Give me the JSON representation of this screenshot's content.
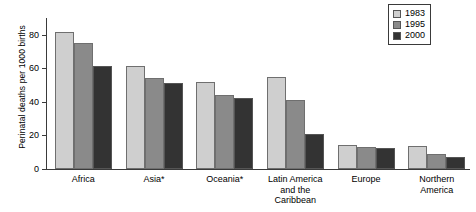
{
  "chart_data": {
    "type": "bar",
    "title": "",
    "xlabel": "",
    "ylabel": "Perinatal deaths per 1000 births",
    "ylim": [
      0,
      90
    ],
    "yticks": [
      0,
      20,
      40,
      60,
      80
    ],
    "ytick_labels": [
      "0",
      "20",
      "40",
      "60",
      "80"
    ],
    "grid": false,
    "legend_position": "top-right",
    "categories": [
      "Africa",
      "Asia*",
      "Oceania*",
      "Latin America\nand the\nCaribbean",
      "Europe",
      "Northern\nAmerica"
    ],
    "series": [
      {
        "name": "1983",
        "color": "#cfcfcf",
        "values": [
          81.5,
          61.5,
          52,
          55,
          14.5,
          14
        ]
      },
      {
        "name": "1995",
        "color": "#8a8a8a",
        "values": [
          75,
          54,
          44,
          41,
          13,
          9
        ]
      },
      {
        "name": "2000",
        "color": "#333333",
        "values": [
          61.5,
          51,
          42.5,
          21,
          12.5,
          7
        ]
      }
    ]
  },
  "legend": {
    "items": [
      {
        "label": "1983"
      },
      {
        "label": "1995"
      },
      {
        "label": "2000"
      }
    ]
  },
  "axis": {
    "y_title": "Perinatal deaths per 1000 births"
  }
}
